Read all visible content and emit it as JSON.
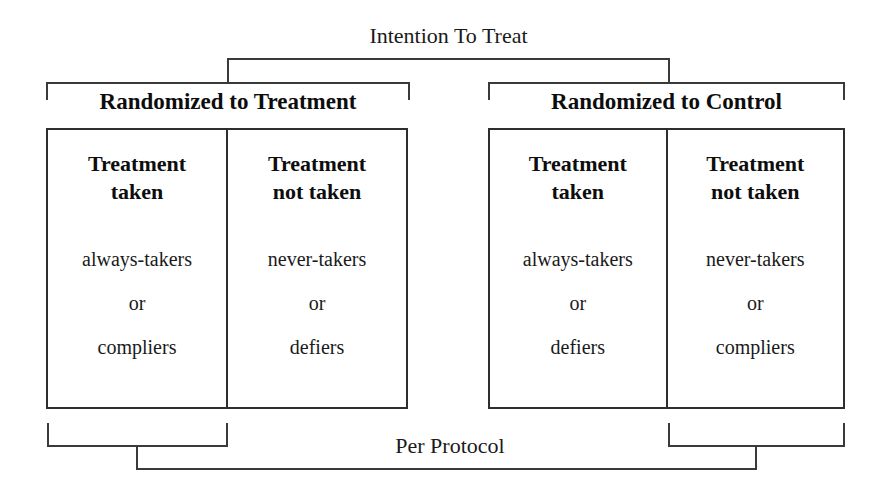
{
  "diagram": {
    "title_top": "Intention To Treat",
    "title_bottom": "Per Protocol",
    "arms": [
      {
        "label": "Randomized to Treatment",
        "cells": [
          {
            "title_line1": "Treatment",
            "title_line2": "taken",
            "type1": "always-takers",
            "conjunction": "or",
            "type2": "compliers"
          },
          {
            "title_line1": "Treatment",
            "title_line2": "not taken",
            "type1": "never-takers",
            "conjunction": "or",
            "type2": "defiers"
          }
        ]
      },
      {
        "label": "Randomized to Control",
        "cells": [
          {
            "title_line1": "Treatment",
            "title_line2": "taken",
            "type1": "always-takers",
            "conjunction": "or",
            "type2": "defiers"
          },
          {
            "title_line1": "Treatment",
            "title_line2": "not taken",
            "type1": "never-takers",
            "conjunction": "or",
            "type2": "compliers"
          }
        ]
      }
    ],
    "colors": {
      "line": "#3a3a3a",
      "box_border": "#2e2e2e",
      "text": "#111111",
      "background": "#ffffff"
    }
  }
}
